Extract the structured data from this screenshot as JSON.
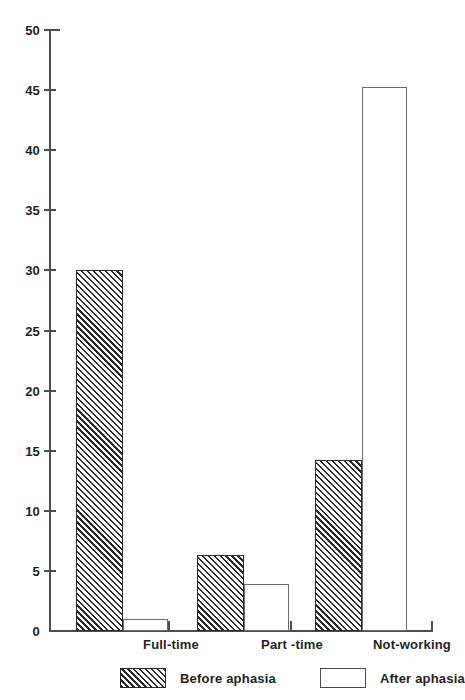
{
  "chart_data": {
    "type": "bar",
    "title": "",
    "subtitle": "",
    "xlabel": "",
    "ylabel": "",
    "categories": [
      "Full-time",
      "Part -time",
      "Not-working"
    ],
    "series": [
      {
        "name": "Before aphasia",
        "values": [
          30,
          6.3,
          14.2
        ],
        "style": "hatched"
      },
      {
        "name": "After aphasia",
        "values": [
          1,
          3.9,
          45.3
        ],
        "style": "open"
      }
    ],
    "ylim": [
      0,
      50
    ],
    "yticks": [
      0,
      5,
      10,
      15,
      20,
      25,
      30,
      35,
      40,
      45,
      50
    ],
    "ytick_labels": [
      "0",
      "5",
      "10",
      "15",
      "20",
      "25",
      "30",
      "35",
      "40",
      "45",
      "50"
    ],
    "grid": false,
    "legend_position": "bottom",
    "colors": {
      "axis": "#4d4d4d",
      "hatch": "#2b2b2b",
      "open_fill": "#ffffff",
      "open_stroke": "#6b6b6b",
      "text": "#1f1f1f",
      "background": "#ffffff"
    }
  },
  "legend": {
    "items": [
      {
        "label": "Before aphasia",
        "swatch": "hatched-swatch-icon"
      },
      {
        "label": "After aphasia",
        "swatch": "open-swatch-icon"
      }
    ]
  }
}
